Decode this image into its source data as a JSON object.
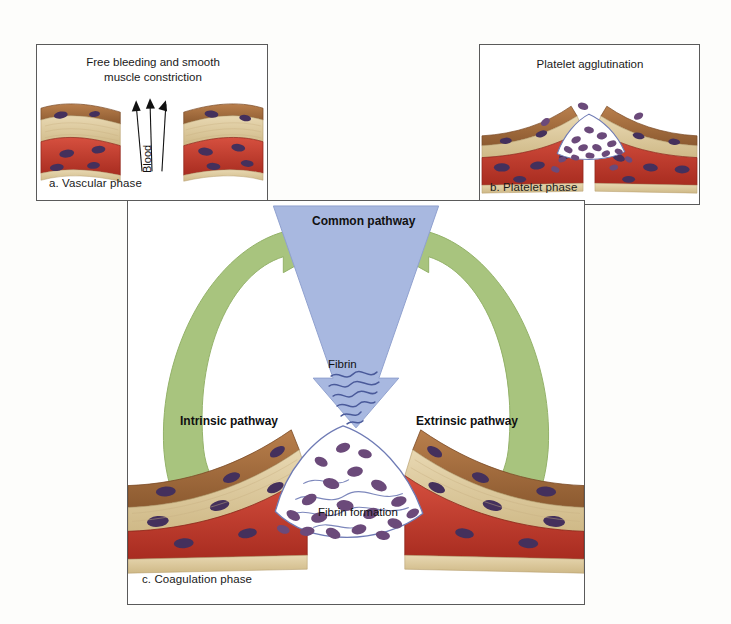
{
  "figure": {
    "background_color": "#fdfdfb"
  },
  "colors": {
    "common_pathway_blue": "#a8b8e0",
    "pathway_green": "#a8c47e",
    "platelet_purple": "#6b4a7a",
    "muscle_red": "#c0392b",
    "endothelium_brown": "#a0683c",
    "connective_tan": "#ddc9a0",
    "fibrin_line": "#4a5a9a",
    "panel_border": "#5a5a5a",
    "text": "#111111"
  },
  "panel_a": {
    "name": "Vascular phase panel",
    "title": "Free bleeding and smooth\nmuscle constriction",
    "caption": "a. Vascular phase",
    "blood_label": "Blood",
    "arrow_count": 3
  },
  "panel_b": {
    "name": "Platelet phase panel",
    "title": "Platelet agglutination",
    "caption": "b. Platelet phase"
  },
  "panel_c": {
    "name": "Coagulation phase panel",
    "caption": "c. Coagulation phase",
    "common_pathway": "Common pathway",
    "fibrin": "Fibrin",
    "fibrin_formation": "Fibrin formation",
    "intrinsic_pathway": "Intrinsic pathway",
    "extrinsic_pathway": "Extrinsic pathway"
  }
}
